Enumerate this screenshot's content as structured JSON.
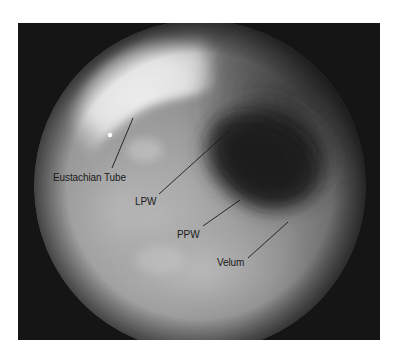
{
  "figure": {
    "type": "endoscopic-image",
    "frame_color": "#151515",
    "labels": [
      {
        "id": "eustachian-tube",
        "text": "Eustachian Tube",
        "x": 53,
        "y": 172,
        "line": [
          112,
          168,
          133,
          118
        ]
      },
      {
        "id": "lpw",
        "text": "LPW",
        "x": 135,
        "y": 196,
        "line": [
          159,
          194,
          230,
          130
        ]
      },
      {
        "id": "ppw",
        "text": "PPW",
        "x": 177,
        "y": 229,
        "line": [
          203,
          226,
          240,
          200
        ]
      },
      {
        "id": "velum",
        "text": "Velum",
        "x": 217,
        "y": 257,
        "line": [
          248,
          258,
          288,
          222
        ]
      }
    ]
  }
}
